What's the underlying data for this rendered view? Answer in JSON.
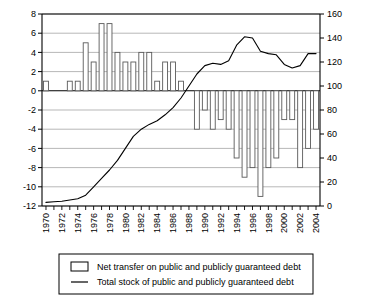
{
  "chart_data": {
    "type": "bar",
    "title": "",
    "subtitle": "",
    "xlabel": "",
    "ylabel_left": "",
    "ylabel_right": "",
    "grid": true,
    "legend_position": "bottom",
    "x": [
      1970,
      1971,
      1972,
      1973,
      1974,
      1975,
      1976,
      1977,
      1978,
      1979,
      1980,
      1981,
      1982,
      1983,
      1984,
      1985,
      1986,
      1987,
      1988,
      1989,
      1990,
      1991,
      1992,
      1993,
      1994,
      1995,
      1996,
      1997,
      1998,
      1999,
      2000,
      2001,
      2002,
      2003,
      2004
    ],
    "xtick_labels": [
      "1970",
      "1972",
      "1974",
      "1976",
      "1978",
      "1980",
      "1982",
      "1984",
      "1986",
      "1988",
      "1990",
      "1992",
      "1994",
      "1996",
      "1998",
      "2000",
      "2002",
      "2004"
    ],
    "ylim_left": [
      -12,
      8
    ],
    "ytick_labels_left": [
      "8",
      "6",
      "4",
      "2",
      "0",
      "-2",
      "-4",
      "-6",
      "-8",
      "-10",
      "-12"
    ],
    "ytick_values_left": [
      8,
      6,
      4,
      2,
      0,
      -2,
      -4,
      -6,
      -8,
      -10,
      -12
    ],
    "ylim_right": [
      0,
      160
    ],
    "ytick_labels_right": [
      "160",
      "140",
      "120",
      "100",
      "80",
      "60",
      "40",
      "20",
      "0"
    ],
    "ytick_values_right": [
      160,
      140,
      120,
      100,
      80,
      60,
      40,
      20,
      0
    ],
    "series": [
      {
        "name": "Net transfer on public and publicly guaranteed debt",
        "type": "bar",
        "axis": "left",
        "values": [
          1,
          0,
          0,
          1,
          1,
          5,
          3,
          7,
          7,
          4,
          3,
          3,
          4,
          4,
          1,
          3,
          3,
          1,
          0,
          -4,
          -2,
          -4,
          -3,
          -4,
          -7,
          -9,
          -8,
          -11,
          -8,
          -7,
          -3,
          -3,
          -8,
          -6,
          -4
        ]
      },
      {
        "name": "Total stock of public and publicly guaranteed debt",
        "type": "line",
        "axis": "right",
        "values": [
          3,
          3.5,
          4,
          5,
          6,
          9,
          16,
          23,
          30,
          38,
          48,
          58,
          64,
          68,
          71,
          76,
          82,
          90,
          100,
          110,
          117,
          119,
          118,
          121,
          134,
          141,
          140,
          129,
          127,
          126,
          118,
          115,
          117,
          127,
          127
        ]
      }
    ]
  },
  "legend": {
    "items": [
      {
        "marker": "bar-swatch",
        "label": "Net transfer on public and publicly guaranteed debt"
      },
      {
        "marker": "line-swatch",
        "label": "Total stock of public and publicly guaranteed debt"
      }
    ]
  }
}
